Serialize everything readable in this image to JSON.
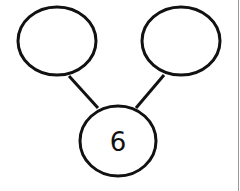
{
  "diagram": {
    "type": "number-bond",
    "whole": "6",
    "parts": [
      "",
      ""
    ],
    "stroke_color": "#111111",
    "edge_line_color": "#9a9a9a"
  }
}
